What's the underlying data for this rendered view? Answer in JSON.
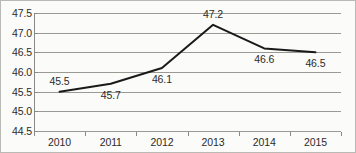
{
  "chart_data": {
    "type": "line",
    "title": "",
    "subtitle": "",
    "xlabel": "",
    "ylabel": "",
    "categories": [
      "2010",
      "2011",
      "2012",
      "2013",
      "2014",
      "2015"
    ],
    "values": [
      45.5,
      45.7,
      46.1,
      47.2,
      46.6,
      46.5
    ],
    "data_labels": [
      "45.5",
      "45.7",
      "46.1",
      "47.2",
      "46.6",
      "46.5"
    ],
    "data_label_positions": [
      "above",
      "below",
      "below",
      "above",
      "below",
      "below"
    ],
    "ylim": [
      44.5,
      47.5
    ],
    "ytick_labels": [
      "47.5",
      "47.0",
      "46.5",
      "46.0",
      "45.5",
      "45.0",
      "44.5"
    ],
    "ytick_values": [
      47.5,
      47.0,
      46.5,
      46.0,
      45.5,
      45.0,
      44.5
    ],
    "ytick_step": 0.5,
    "grid": true,
    "legend": false,
    "legend_position": "none",
    "series_color": "#1a1a1a",
    "gridline_color": "#9a9a94",
    "axis_color": "#8a8a84",
    "text_color": "#2b2b2b",
    "background_color": "#fbfbf9",
    "border_color": "#b9b9b5"
  }
}
